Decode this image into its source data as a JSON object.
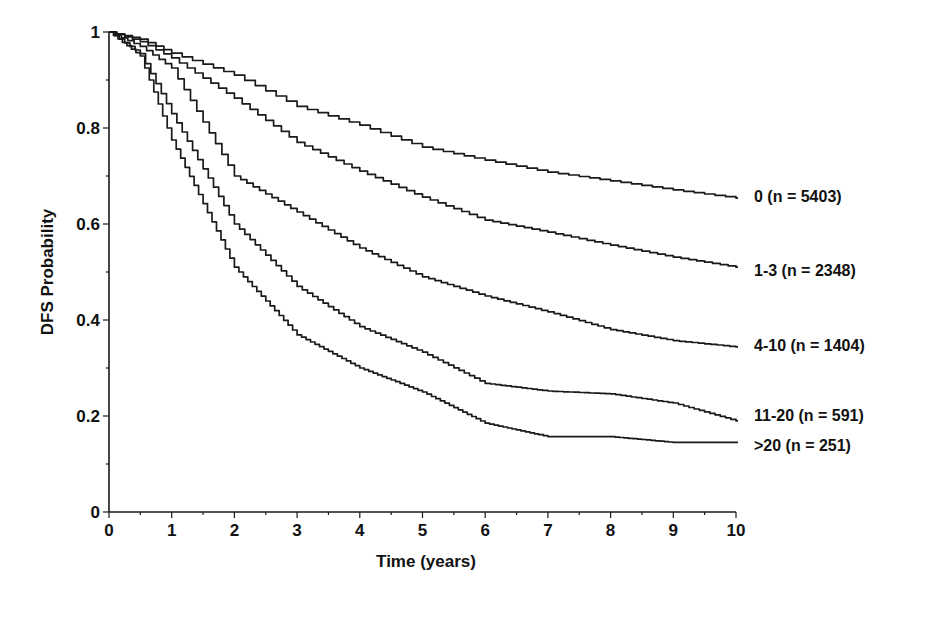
{
  "chart_data": {
    "type": "line",
    "subtype": "kaplan-meier step curves",
    "title": "",
    "xlabel": "Time (years)",
    "ylabel": "DFS Probability",
    "xlim": [
      0,
      10
    ],
    "ylim": [
      0,
      1
    ],
    "x_ticks": [
      0,
      1,
      2,
      3,
      4,
      5,
      6,
      7,
      8,
      9,
      10
    ],
    "x_tick_labels": [
      "0",
      "1",
      "2",
      "3",
      "4",
      "5",
      "6",
      "7",
      "8",
      "9",
      "10"
    ],
    "y_ticks": [
      0,
      0.2,
      0.4,
      0.6,
      0.8,
      1
    ],
    "y_tick_labels": [
      "0",
      "0.2",
      "0.4",
      "0.6",
      "0.8",
      "1"
    ],
    "grid": false,
    "legend_position": "inline labels at right end of each curve",
    "x": [
      0,
      0.5,
      1,
      2,
      3,
      4,
      5,
      6,
      7,
      8,
      9,
      10
    ],
    "series": [
      {
        "name": "0 (n = 5403)",
        "label": "0 (n = 5403)",
        "values": [
          1.0,
          0.985,
          0.956,
          0.91,
          0.845,
          0.806,
          0.76,
          0.733,
          0.708,
          0.69,
          0.671,
          0.654
        ]
      },
      {
        "name": "1-3 (n = 2348)",
        "label": "1-3 (n = 2348)",
        "values": [
          1.0,
          0.98,
          0.946,
          0.862,
          0.77,
          0.71,
          0.656,
          0.608,
          0.583,
          0.556,
          0.531,
          0.51
        ]
      },
      {
        "name": "4-10 (n = 1404)",
        "label": "4-10 (n = 1404)",
        "values": [
          1.0,
          0.97,
          0.925,
          0.7,
          0.625,
          0.55,
          0.49,
          0.45,
          0.417,
          0.38,
          0.357,
          0.344
        ]
      },
      {
        "name": "11-20 (n = 591)",
        "label": "11-20 (n = 591)",
        "values": [
          1.0,
          0.955,
          0.83,
          0.6,
          0.47,
          0.386,
          0.333,
          0.268,
          0.252,
          0.246,
          0.227,
          0.19
        ]
      },
      {
        "name": ">20 (n = 251)",
        "label": ">20 (n = 251)",
        "values": [
          1.0,
          0.95,
          0.775,
          0.51,
          0.369,
          0.3,
          0.25,
          0.185,
          0.157,
          0.157,
          0.145,
          0.145
        ]
      }
    ]
  },
  "plot_layout": {
    "x0_px": 109,
    "x10_px": 736,
    "y0_px": 512,
    "y1_px": 32,
    "label_x_px": 754,
    "label_y_px": [
      196,
      270,
      345,
      415,
      445
    ]
  }
}
